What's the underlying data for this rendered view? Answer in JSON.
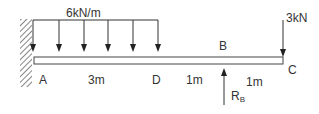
{
  "diagram": {
    "type": "cantilever-beam-with-support",
    "distributed_load": {
      "label": "6kN/m",
      "from": "A",
      "to": "D",
      "arrow_count": 6
    },
    "point_load": {
      "label": "3kN",
      "at": "C",
      "direction": "down"
    },
    "reaction": {
      "label_main": "R",
      "label_sub": "B",
      "at": "B",
      "direction": "up"
    },
    "points": {
      "A": "A",
      "D": "D",
      "B": "B",
      "C": "C"
    },
    "dimensions": {
      "AD": "3m",
      "DB": "1m",
      "BC": "1m"
    },
    "colors": {
      "line": "#333333",
      "hatch": "#555555",
      "background": "#ffffff"
    }
  }
}
